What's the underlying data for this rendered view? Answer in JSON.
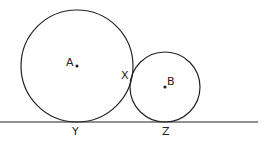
{
  "diagram": {
    "circles": [
      {
        "name": "A",
        "cx": 77,
        "cy": 66,
        "r": 56
      },
      {
        "name": "B",
        "cx": 165,
        "cy": 87,
        "r": 35
      }
    ],
    "line": {
      "x1": 0,
      "y1": 122,
      "x2": 258,
      "y2": 122
    },
    "labels": {
      "A": "A",
      "B": "B",
      "X": "X",
      "Y": "Y",
      "Z": "Z"
    },
    "stroke_color": "#222222"
  }
}
